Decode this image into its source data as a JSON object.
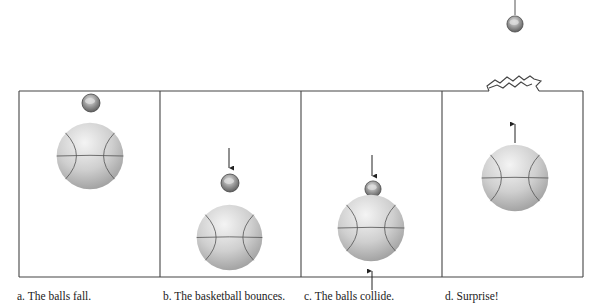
{
  "figure": {
    "panels": [
      {
        "id": "a",
        "caption": "a. The balls fall."
      },
      {
        "id": "b",
        "caption": "b. The basketball bounces."
      },
      {
        "id": "c",
        "caption": "c. The balls collide."
      },
      {
        "id": "d",
        "caption": "d. Surprise!"
      }
    ],
    "colors": {
      "frame": "#444444",
      "ball_light": "#f2f2f2",
      "ball_dark": "#9a9a9a",
      "seam": "#555555",
      "arrow": "#222222"
    }
  }
}
